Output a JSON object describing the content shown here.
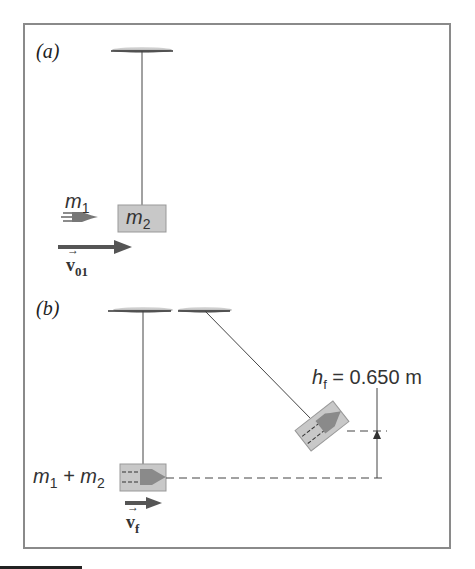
{
  "panels": {
    "a": {
      "label": "(a)",
      "projectile_mass": "m",
      "projectile_mass_sub": "1",
      "block_mass": "m",
      "block_mass_sub": "2",
      "velocity_label": "v",
      "velocity_sub": "01"
    },
    "b": {
      "label": "(b)",
      "combined_mass": "m",
      "combined_mass_sub1": "1",
      "combined_plus": " + m",
      "combined_mass_sub2": "2",
      "velocity_label": "v",
      "velocity_sub": "f",
      "height_symbol": "h",
      "height_sub": "f",
      "height_value": " = 0.650 m"
    }
  },
  "colors": {
    "frame": "#8a8a8a",
    "block_fill": "#c8c8c8",
    "arrow": "#555555",
    "line": "#444444"
  }
}
